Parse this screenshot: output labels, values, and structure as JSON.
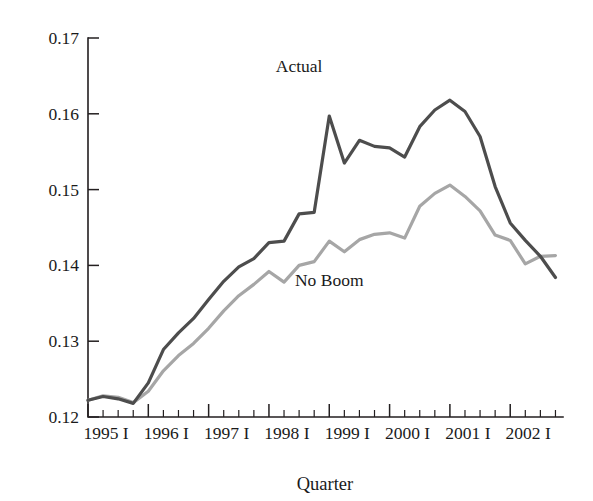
{
  "chart_data": {
    "type": "line",
    "title": "",
    "subtitle": "",
    "xlabel": "Quarter",
    "ylabel": "",
    "ylim": [
      0.12,
      0.17
    ],
    "yticks": [
      0.12,
      0.13,
      0.14,
      0.15,
      0.16,
      0.17
    ],
    "ytick_labels": [
      "0.12",
      "0.13",
      "0.14",
      "0.15",
      "0.16",
      "0.17"
    ],
    "grid": false,
    "legend_position": "inline-annotations",
    "x_major_labels": [
      "1995 I",
      "1996 I",
      "1997 I",
      "1998 I",
      "1999 I",
      "2000 I",
      "2001 I",
      "2002 I"
    ],
    "x_minor_per_major": 3,
    "x": [
      "1995 I",
      "1995 II",
      "1995 III",
      "1995 IV",
      "1996 I",
      "1996 II",
      "1996 III",
      "1996 IV",
      "1997 I",
      "1997 II",
      "1997 III",
      "1997 IV",
      "1998 I",
      "1998 II",
      "1998 III",
      "1998 IV",
      "1999 I",
      "1999 II",
      "1999 III",
      "1999 IV",
      "2000 I",
      "2000 II",
      "2000 III",
      "2000 IV",
      "2001 I",
      "2001 II",
      "2001 III",
      "2001 IV",
      "2002 I",
      "2002 II",
      "2002 III",
      "2002 IV"
    ],
    "series": [
      {
        "name": "Actual",
        "color": "#4d4d4d",
        "label_x": "1998 III",
        "label_y": 0.1655,
        "values": [
          0.1222,
          0.1227,
          0.1224,
          0.1218,
          0.1245,
          0.1289,
          0.1311,
          0.133,
          0.1355,
          0.1379,
          0.1398,
          0.1409,
          0.143,
          0.1432,
          0.1468,
          0.147,
          0.1597,
          0.1535,
          0.1565,
          0.1557,
          0.1555,
          0.1543,
          0.1583,
          0.1605,
          0.1618,
          0.1603,
          0.157,
          0.1504,
          0.1456,
          0.1433,
          0.1412,
          0.1384
        ]
      },
      {
        "name": "No Boom",
        "color": "#a6a6a6",
        "label_x": "1999 I",
        "label_y": 0.1373,
        "values": [
          0.1222,
          0.1228,
          0.1226,
          0.1219,
          0.1234,
          0.1261,
          0.1281,
          0.1297,
          0.1317,
          0.134,
          0.136,
          0.1375,
          0.1392,
          0.1378,
          0.14,
          0.1405,
          0.1432,
          0.1418,
          0.1434,
          0.1441,
          0.1443,
          0.1436,
          0.1478,
          0.1495,
          0.1506,
          0.1491,
          0.1472,
          0.144,
          0.1433,
          0.1402,
          0.1412,
          0.1413
        ]
      }
    ],
    "annotations": [
      {
        "text": "Actual",
        "series": "Actual"
      },
      {
        "text": "No Boom",
        "series": "No Boom"
      }
    ]
  },
  "figure": {
    "xaxis_title": "Quarter",
    "background": "#ffffff"
  }
}
